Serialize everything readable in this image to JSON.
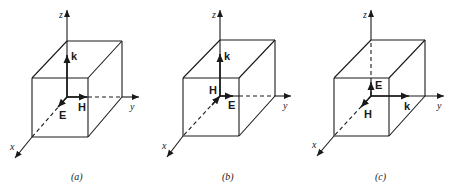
{
  "figure": {
    "stroke_color": "#1a1a1a",
    "background": "#ffffff"
  },
  "panels": [
    {
      "id": "a",
      "caption": "(a)",
      "axes": {
        "x": "x",
        "y": "y",
        "z": "z"
      },
      "vectors": [
        {
          "name": "k",
          "label": "k",
          "direction": "+z"
        },
        {
          "name": "E",
          "label": "E",
          "direction": "+x"
        },
        {
          "name": "H",
          "label": "H",
          "direction": "+y"
        }
      ],
      "geom": {
        "origin": [
          67,
          97
        ],
        "z_tip": [
          67,
          10
        ],
        "y_tip": [
          139,
          97
        ],
        "x_tip": [
          15,
          158
        ],
        "btl": [
          67,
          41
        ],
        "btr": [
          122,
          41
        ],
        "bbr": [
          122,
          97
        ],
        "ftl": [
          32,
          78
        ],
        "ftr": [
          88,
          78
        ],
        "fbl": [
          32,
          137
        ],
        "fbr": [
          88,
          137
        ],
        "z_dashed": false,
        "y_dash_from": 88,
        "y_dash_to": 122,
        "x_dash_from": [
          67,
          97
        ],
        "x_dash_to": [
          32,
          137
        ],
        "k_vec": [
          [
            67,
            97
          ],
          [
            67,
            55
          ]
        ],
        "E_vec": [
          [
            67,
            97
          ],
          [
            58,
            107
          ]
        ],
        "H_vec": [
          [
            67,
            97
          ],
          [
            87,
            97
          ]
        ]
      },
      "labels": {
        "z": [
          59,
          10
        ],
        "y": [
          130,
          102
        ],
        "x": [
          10,
          142
        ],
        "k": [
          71,
          51
        ],
        "E": [
          59,
          110
        ],
        "H": [
          78,
          102
        ],
        "caption": [
          71,
          172
        ]
      }
    },
    {
      "id": "b",
      "caption": "(b)",
      "axes": {
        "x": "x",
        "y": "y",
        "z": "z"
      },
      "vectors": [
        {
          "name": "k",
          "label": "k",
          "direction": "+z"
        },
        {
          "name": "E",
          "label": "E",
          "direction": "+y"
        },
        {
          "name": "H",
          "label": "H",
          "direction": "-x"
        }
      ],
      "geom": {
        "origin": [
          220,
          96
        ],
        "z_tip": [
          220,
          10
        ],
        "y_tip": [
          291,
          96
        ],
        "x_tip": [
          167,
          157
        ],
        "btl": [
          220,
          40
        ],
        "btr": [
          275,
          40
        ],
        "bbr": [
          275,
          96
        ],
        "ftl": [
          183,
          78
        ],
        "ftr": [
          239,
          78
        ],
        "fbl": [
          183,
          136
        ],
        "fbr": [
          239,
          136
        ],
        "z_dashed": false,
        "y_dash_from": 239,
        "y_dash_to": 275,
        "x_dash_from": [
          220,
          96
        ],
        "x_dash_to": [
          183,
          136
        ],
        "k_vec": [
          [
            220,
            96
          ],
          [
            220,
            54
          ]
        ],
        "E_vec": [
          [
            220,
            96
          ],
          [
            233,
            96
          ]
        ],
        "H_vec": [
          [
            212,
            105
          ],
          [
            220,
            96
          ]
        ]
      },
      "labels": {
        "z": [
          212,
          10
        ],
        "y": [
          283,
          101
        ],
        "x": [
          162,
          141
        ],
        "k": [
          224,
          51
        ],
        "E": [
          228,
          100
        ],
        "H": [
          209,
          85
        ],
        "caption": [
          222,
          172
        ]
      }
    },
    {
      "id": "c",
      "caption": "(c)",
      "axes": {
        "x": "x",
        "y": "y",
        "z": "z"
      },
      "vectors": [
        {
          "name": "k",
          "label": "k",
          "direction": "+y"
        },
        {
          "name": "E",
          "label": "E",
          "direction": "+z"
        },
        {
          "name": "H",
          "label": "H",
          "direction": "+x"
        }
      ],
      "geom": {
        "origin": [
          371,
          96
        ],
        "z_tip": [
          371,
          10
        ],
        "y_tip": [
          444,
          96
        ],
        "x_tip": [
          317,
          156
        ],
        "btl": [
          371,
          40
        ],
        "btr": [
          425,
          40
        ],
        "bbr": [
          425,
          96
        ],
        "ftl": [
          334,
          78
        ],
        "ftr": [
          389,
          78
        ],
        "fbl": [
          334,
          136
        ],
        "fbr": [
          389,
          136
        ],
        "z_dashed": true,
        "y_dash_from": null,
        "y_dash_to": null,
        "x_dash_from": [
          371,
          96
        ],
        "x_dash_to": [
          334,
          136
        ],
        "k_vec": [
          [
            371,
            96
          ],
          [
            409,
            96
          ]
        ],
        "E_vec": [
          [
            371,
            96
          ],
          [
            371,
            82
          ]
        ],
        "H_vec": [
          [
            371,
            96
          ],
          [
            361,
            107
          ]
        ]
      },
      "labels": {
        "z": [
          363,
          10
        ],
        "y": [
          437,
          101
        ],
        "x": [
          312,
          140
        ],
        "k": [
          404,
          101
        ],
        "E": [
          375,
          80
        ],
        "H": [
          364,
          109
        ],
        "caption": [
          375,
          172
        ]
      }
    }
  ]
}
